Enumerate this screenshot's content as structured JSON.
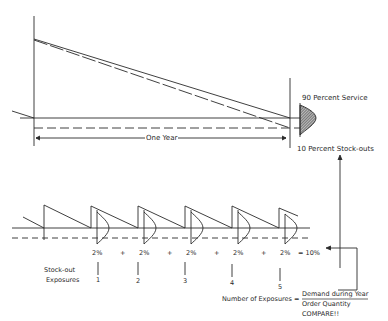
{
  "top": {
    "one_year": "One Year",
    "service": "90 Percent Service",
    "stockouts": "10 Percent Stock-outs"
  },
  "bottom": {
    "percents": [
      "2%",
      "2%",
      "2%",
      "2%",
      "2%"
    ],
    "plus": "+",
    "total": "= 10%",
    "exposure_label_1": "Stock-out",
    "exposure_label_2": "Exposures",
    "exposure_numbers": [
      "1",
      "2",
      "3",
      "4",
      "5"
    ],
    "formula_lhs": "Number of Exposures =",
    "numerator": "Demand during Year",
    "denominator": "Order Quantity",
    "compare": "COMPARE!!"
  },
  "colors": {
    "ink": "#2a2a2a",
    "hatch": "#555555"
  }
}
